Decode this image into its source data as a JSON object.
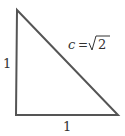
{
  "diagram": {
    "type": "right-triangle",
    "colors": {
      "stroke": "#555555",
      "text": "#333333",
      "background": "#ffffff"
    },
    "vertices": {
      "top": [
        17,
        10
      ],
      "bottom_left": [
        16,
        115
      ],
      "bottom_right": [
        118,
        115
      ]
    },
    "labels": {
      "left_side": "1",
      "bottom_side": "1",
      "hypotenuse_var": "c",
      "hypotenuse_eq": "=",
      "hypotenuse_value": "2"
    }
  }
}
